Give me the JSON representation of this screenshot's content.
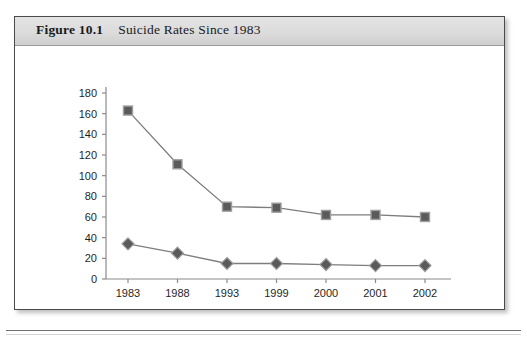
{
  "figure": {
    "number": "Figure 10.1",
    "title": "Suicide Rates Since 1983"
  },
  "chart_data": {
    "type": "line",
    "title": "Suicide Rates Since 1983",
    "xlabel": "",
    "ylabel": "",
    "categories": [
      "1983",
      "1988",
      "1993",
      "1999",
      "2000",
      "2001",
      "2002"
    ],
    "series": [
      {
        "name": "Jail",
        "marker": "square",
        "color": "#5a5a5a",
        "values": [
          163,
          111,
          70,
          69,
          62,
          62,
          60
        ]
      },
      {
        "name": "Prison",
        "marker": "diamond",
        "color": "#5a5a5a",
        "values": [
          34,
          25,
          15,
          15,
          14,
          13,
          13
        ]
      }
    ],
    "ylim": [
      0,
      180
    ],
    "yticks": [
      0,
      20,
      40,
      60,
      80,
      100,
      120,
      140,
      160,
      180
    ],
    "ytick_labels": [
      "0",
      "20",
      "40",
      "60",
      "80",
      "100",
      "120",
      "140",
      "160",
      "180"
    ],
    "grid": false,
    "legend_position": "bottom",
    "legend_entries": [
      "Jail",
      "Prison"
    ]
  },
  "colors": {
    "line": "#7d7d7d",
    "marker_fill": "#5a5a5a",
    "marker_stroke": "#9e9e9e",
    "axis": "#8a8a8a",
    "text": "#1f1f1f",
    "frame": "#4a4a4a",
    "caption_bg": "#dcdcdc"
  }
}
